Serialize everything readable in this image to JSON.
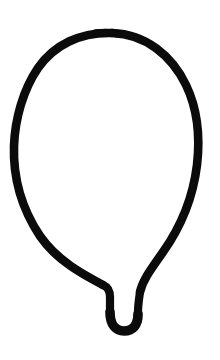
{
  "canvas": {
    "width": 220,
    "height": 360,
    "background_color": "#ffffff",
    "ink_color": "#0b0b0b",
    "title": "Balloon Sketch",
    "subject": "balloon",
    "style": "hand-drawn single-stroke outline",
    "stroke_width_px": 8.6
  },
  "drawing": {
    "name": "balloon",
    "description": "Hand-drawn black outline of a balloon: a tall rounded oval body narrowing at the bottom into a short neck that ends in a small U-shaped knot.",
    "parts": [
      {
        "name": "balloon-body-outline",
        "icon": "balloon-body-icon",
        "path": "M 112 33 C 146 34 172 56 186 85 C 198 110 200 139 197 165 C 193 198 180 228 163 252 C 152 268 143 279 140 292",
        "stroke_class": "ink-body",
        "bounds": {
          "x_min": 14,
          "x_max": 199,
          "y_min": 30,
          "y_max": 295
        }
      },
      {
        "name": "balloon-body-outline-left",
        "icon": "balloon-body-icon",
        "path": "M 112 33 C 80 32 54 45 38 68 C 23 90 15 119 14 146 C 13 178 22 209 40 236 C 58 262 86 276 103 285",
        "stroke_class": "ink-body",
        "bounds": {
          "x_min": 14,
          "x_max": 112,
          "y_min": 30,
          "y_max": 288
        }
      },
      {
        "name": "balloon-neck-left",
        "icon": "balloon-neck-icon",
        "path": "M 103 285 C 108 287 110 291 110 297 L 110 314",
        "stroke_class": "ink-neck"
      },
      {
        "name": "balloon-neck-right",
        "icon": "balloon-neck-icon",
        "path": "M 140 292 C 139 299 138 305 138 312 L 138 320",
        "stroke_class": "ink-neck"
      },
      {
        "name": "balloon-knot",
        "icon": "balloon-knot-icon",
        "path": "M 110 312 C 110 325 116 331 124 331 C 133 331 138 325 138 314",
        "stroke_class": "ink-knot",
        "bounds": {
          "x_min": 105,
          "x_max": 142,
          "y_min": 305,
          "y_max": 333
        }
      },
      {
        "name": "balloon-shoulder-touchup",
        "icon": "balloon-body-icon",
        "path": "M 96 33 C 104 32 110 32 118 34",
        "stroke_class": "ink-touchup"
      }
    ]
  }
}
